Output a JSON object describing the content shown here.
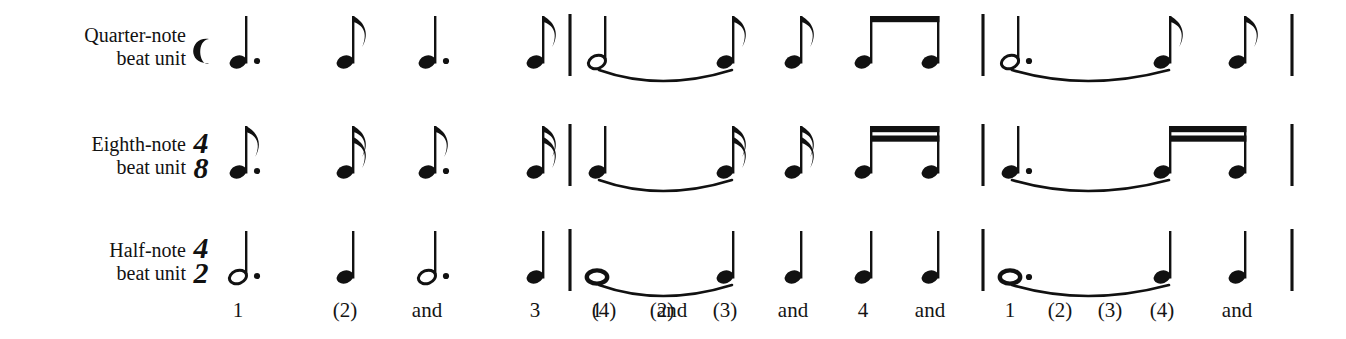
{
  "figure": {
    "background_color": "#ffffff",
    "ink_color": "#111111",
    "width": 1346,
    "height": 339
  },
  "rows": [
    {
      "id": "quarter-note-row",
      "label_line1": "Quarter-note",
      "label_line2": "beat unit",
      "time_signature": {
        "symbol": "common-time",
        "glyph": "C",
        "numerator": "",
        "denominator": ""
      },
      "baseline_y": 62,
      "beat_note": "quarter",
      "measures": [
        {
          "index": 1,
          "notes": [
            {
              "x": 238,
              "type": "quarter",
              "head": "filled",
              "dotted": true,
              "flags": 0,
              "stem": "up"
            },
            {
              "x": 345,
              "type": "eighth",
              "head": "filled",
              "dotted": false,
              "flags": 1,
              "stem": "up"
            },
            {
              "x": 427,
              "type": "quarter",
              "head": "filled",
              "dotted": true,
              "flags": 0,
              "stem": "up"
            },
            {
              "x": 535,
              "type": "eighth",
              "head": "filled",
              "dotted": false,
              "flags": 1,
              "stem": "up"
            }
          ],
          "beams": [],
          "ties": []
        },
        {
          "index": 2,
          "notes": [
            {
              "x": 597,
              "type": "half",
              "head": "open",
              "dotted": false,
              "flags": 0,
              "stem": "up"
            },
            {
              "x": 725,
              "type": "eighth",
              "head": "filled",
              "dotted": false,
              "flags": 1,
              "stem": "up"
            },
            {
              "x": 793,
              "type": "eighth",
              "head": "filled",
              "dotted": false,
              "flags": 1,
              "stem": "up"
            },
            {
              "x": 863,
              "type": "eighth",
              "head": "filled",
              "dotted": false,
              "flags": 0,
              "stem": "up"
            },
            {
              "x": 930,
              "type": "eighth",
              "head": "filled",
              "dotted": false,
              "flags": 0,
              "stem": "up"
            }
          ],
          "beams": [
            {
              "from": 863,
              "to": 930,
              "count": 1
            }
          ],
          "ties": [
            {
              "from": 597,
              "to": 725
            }
          ]
        },
        {
          "index": 3,
          "notes": [
            {
              "x": 1010,
              "type": "half",
              "head": "open",
              "dotted": true,
              "flags": 0,
              "stem": "up"
            },
            {
              "x": 1162,
              "type": "eighth",
              "head": "filled",
              "dotted": false,
              "flags": 1,
              "stem": "up"
            },
            {
              "x": 1237,
              "type": "eighth",
              "head": "filled",
              "dotted": false,
              "flags": 1,
              "stem": "up"
            }
          ],
          "beams": [],
          "ties": [
            {
              "from": 1010,
              "to": 1162
            }
          ]
        }
      ]
    },
    {
      "id": "eighth-note-row",
      "label_line1": "Eighth-note",
      "label_line2": "beat unit",
      "time_signature": {
        "symbol": "numeric",
        "glyph": "",
        "numerator": "4",
        "denominator": "8"
      },
      "baseline_y": 172,
      "beat_note": "eighth",
      "measures": [
        {
          "index": 1,
          "notes": [
            {
              "x": 238,
              "type": "eighth",
              "head": "filled",
              "dotted": true,
              "flags": 1,
              "stem": "up"
            },
            {
              "x": 345,
              "type": "sixteenth",
              "head": "filled",
              "dotted": false,
              "flags": 2,
              "stem": "up"
            },
            {
              "x": 427,
              "type": "eighth",
              "head": "filled",
              "dotted": true,
              "flags": 1,
              "stem": "up"
            },
            {
              "x": 535,
              "type": "sixteenth",
              "head": "filled",
              "dotted": false,
              "flags": 2,
              "stem": "up"
            }
          ],
          "beams": [],
          "ties": []
        },
        {
          "index": 2,
          "notes": [
            {
              "x": 597,
              "type": "quarter",
              "head": "filled",
              "dotted": false,
              "flags": 0,
              "stem": "up"
            },
            {
              "x": 725,
              "type": "sixteenth",
              "head": "filled",
              "dotted": false,
              "flags": 2,
              "stem": "up"
            },
            {
              "x": 793,
              "type": "sixteenth",
              "head": "filled",
              "dotted": false,
              "flags": 2,
              "stem": "up"
            },
            {
              "x": 863,
              "type": "sixteenth",
              "head": "filled",
              "dotted": false,
              "flags": 0,
              "stem": "up"
            },
            {
              "x": 930,
              "type": "sixteenth",
              "head": "filled",
              "dotted": false,
              "flags": 0,
              "stem": "up"
            }
          ],
          "beams": [
            {
              "from": 863,
              "to": 930,
              "count": 2
            }
          ],
          "ties": [
            {
              "from": 597,
              "to": 725
            }
          ]
        },
        {
          "index": 3,
          "notes": [
            {
              "x": 1010,
              "type": "quarter",
              "head": "filled",
              "dotted": true,
              "flags": 0,
              "stem": "up"
            },
            {
              "x": 1162,
              "type": "sixteenth",
              "head": "filled",
              "dotted": false,
              "flags": 0,
              "stem": "up"
            },
            {
              "x": 1237,
              "type": "sixteenth",
              "head": "filled",
              "dotted": false,
              "flags": 0,
              "stem": "up"
            }
          ],
          "beams": [
            {
              "from": 1162,
              "to": 1237,
              "count": 2
            }
          ],
          "ties": [
            {
              "from": 1010,
              "to": 1162
            }
          ]
        }
      ]
    },
    {
      "id": "half-note-row",
      "label_line1": "Half-note",
      "label_line2": "beat unit",
      "time_signature": {
        "symbol": "numeric",
        "glyph": "",
        "numerator": "4",
        "denominator": "2"
      },
      "baseline_y": 277,
      "beat_note": "half",
      "measures": [
        {
          "index": 1,
          "notes": [
            {
              "x": 238,
              "type": "half",
              "head": "open",
              "dotted": true,
              "flags": 0,
              "stem": "up"
            },
            {
              "x": 345,
              "type": "quarter",
              "head": "filled",
              "dotted": false,
              "flags": 0,
              "stem": "up"
            },
            {
              "x": 427,
              "type": "half",
              "head": "open",
              "dotted": true,
              "flags": 0,
              "stem": "up"
            },
            {
              "x": 535,
              "type": "quarter",
              "head": "filled",
              "dotted": false,
              "flags": 0,
              "stem": "up"
            }
          ],
          "beams": [],
          "ties": []
        },
        {
          "index": 2,
          "notes": [
            {
              "x": 597,
              "type": "whole",
              "head": "whole",
              "dotted": false,
              "flags": 0,
              "stem": "none"
            },
            {
              "x": 725,
              "type": "quarter",
              "head": "filled",
              "dotted": false,
              "flags": 0,
              "stem": "up"
            },
            {
              "x": 793,
              "type": "quarter",
              "head": "filled",
              "dotted": false,
              "flags": 0,
              "stem": "up"
            },
            {
              "x": 863,
              "type": "quarter",
              "head": "filled",
              "dotted": false,
              "flags": 0,
              "stem": "up"
            },
            {
              "x": 930,
              "type": "quarter",
              "head": "filled",
              "dotted": false,
              "flags": 0,
              "stem": "up"
            }
          ],
          "beams": [],
          "ties": [
            {
              "from": 597,
              "to": 725
            }
          ]
        },
        {
          "index": 3,
          "notes": [
            {
              "x": 1010,
              "type": "whole",
              "head": "whole",
              "dotted": true,
              "flags": 0,
              "stem": "none"
            },
            {
              "x": 1162,
              "type": "quarter",
              "head": "filled",
              "dotted": false,
              "flags": 0,
              "stem": "up"
            },
            {
              "x": 1237,
              "type": "quarter",
              "head": "filled",
              "dotted": false,
              "flags": 0,
              "stem": "up"
            }
          ],
          "beams": [],
          "ties": [
            {
              "from": 1010,
              "to": 1162
            }
          ]
        }
      ]
    }
  ],
  "barlines": [
    {
      "x": 570,
      "label": "barline-1"
    },
    {
      "x": 983,
      "label": "barline-2"
    },
    {
      "x": 1292,
      "label": "final-barline"
    }
  ],
  "counting": [
    {
      "x": 238,
      "text": "1"
    },
    {
      "x": 345,
      "text": "(2)"
    },
    {
      "x": 427,
      "text": "and"
    },
    {
      "x": 535,
      "text": "3"
    },
    {
      "x": 604,
      "text": "(4)"
    },
    {
      "x": 672,
      "text": "and"
    },
    {
      "x": 597,
      "text": "1"
    },
    {
      "x": 662,
      "text": "(2)"
    },
    {
      "x": 725,
      "text": "(3)"
    },
    {
      "x": 793,
      "text": "and"
    },
    {
      "x": 863,
      "text": "4"
    },
    {
      "x": 930,
      "text": "and"
    },
    {
      "x": 1010,
      "text": "1"
    },
    {
      "x": 1060,
      "text": "(2)"
    },
    {
      "x": 1110,
      "text": "(3)"
    },
    {
      "x": 1162,
      "text": "(4)"
    },
    {
      "x": 1237,
      "text": "and"
    }
  ],
  "counting_row1": [
    {
      "x": 238,
      "text": "1"
    },
    {
      "x": 345,
      "text": "(2)"
    },
    {
      "x": 427,
      "text": "and"
    },
    {
      "x": 500,
      "text": "3"
    },
    {
      "x": 570,
      "text": "(4)"
    },
    {
      "x": 640,
      "text": "and"
    }
  ]
}
